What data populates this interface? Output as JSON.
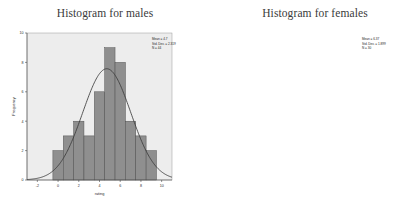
{
  "figure": {
    "background_color": "#ffffff",
    "panel_count": 2
  },
  "chart_data": [
    {
      "type": "bar",
      "title": "Histogram for males",
      "xlabel": "rating",
      "ylabel": "Frequency",
      "categories": [
        "0",
        "1",
        "2",
        "3",
        "4",
        "5",
        "6",
        "7",
        "8",
        "9"
      ],
      "bin_centers": [
        0,
        1,
        2,
        3,
        4,
        5,
        6,
        7,
        8,
        9
      ],
      "values": [
        2,
        3,
        4,
        3,
        6,
        9,
        8,
        4,
        3,
        2
      ],
      "xlim": [
        -3,
        11
      ],
      "ylim": [
        0,
        10
      ],
      "xticks": [
        "-2",
        "0",
        "2",
        "4",
        "6",
        "8",
        "10"
      ],
      "xtick_values": [
        -2,
        0,
        2,
        4,
        6,
        8,
        10
      ],
      "yticks": [
        "0",
        "2",
        "4",
        "6",
        "8",
        "10"
      ],
      "ytick_values": [
        0,
        2,
        4,
        6,
        8,
        10
      ],
      "grid": false,
      "legend": "none",
      "normal_curve": true,
      "bar_color": "#8f8f8f",
      "bar_edge_color": "#4a4a4a",
      "curve_color": "#3b3b3b",
      "plot_background": "#ededed",
      "annotations": {
        "mean_label": "Mean = 4.7",
        "std_dev_label": "Std. Dev. = 2.319",
        "n_label": "N = 44",
        "mean": 4.7,
        "std_dev": 2.319,
        "n": 44
      }
    },
    {
      "type": "bar",
      "title": "Histogram for females",
      "xlabel": "rating",
      "ylabel": "Frequency",
      "categories": [
        "3",
        "4",
        "5",
        "6",
        "7",
        "8",
        "9",
        "10"
      ],
      "bin_centers": [
        3,
        4,
        5,
        6,
        7,
        8,
        9,
        10
      ],
      "values": [
        3,
        4,
        4,
        6,
        8,
        5,
        4,
        1
      ],
      "xlim": [
        1,
        13
      ],
      "ylim": [
        0,
        8
      ],
      "xticks": [
        "2",
        "4",
        "6",
        "8",
        "10",
        "12"
      ],
      "xtick_values": [
        2,
        4,
        6,
        8,
        10,
        12
      ],
      "yticks": [
        "0",
        "2",
        "4",
        "6",
        "8"
      ],
      "ytick_values": [
        0,
        2,
        4,
        6,
        8
      ],
      "grid": false,
      "legend": "none",
      "normal_curve": true,
      "bar_color": "#8f8f8f",
      "bar_edge_color": "#4a4a4a",
      "curve_color": "#3b3b3b",
      "plot_background": "#ededed",
      "annotations": {
        "mean_label": "Mean = 6.37",
        "std_dev_label": "Std. Dev. = 1.899",
        "n_label": "N = 30",
        "mean": 6.37,
        "std_dev": 1.899,
        "n": 30
      }
    }
  ]
}
